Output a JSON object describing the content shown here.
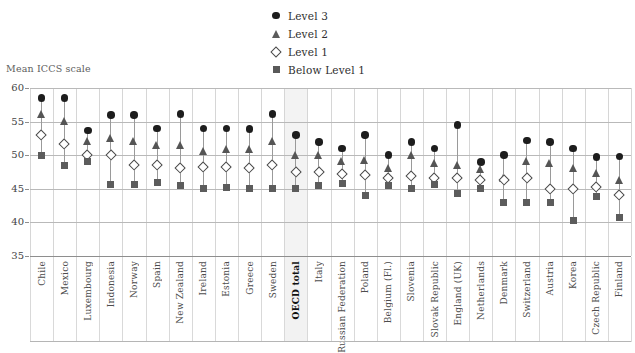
{
  "legend": {
    "position": "top-center",
    "items": [
      {
        "label": "Level 3",
        "marker": "filled-circle-icon",
        "color": "#1d1d1d"
      },
      {
        "label": "Level 2",
        "marker": "filled-triangle-icon",
        "color": "#555555"
      },
      {
        "label": "Level 1",
        "marker": "open-diamond-icon",
        "color": "#4a4a4a"
      },
      {
        "label": "Below Level 1",
        "marker": "filled-square-icon",
        "color": "#5c5c5c"
      }
    ]
  },
  "axis": {
    "y_title": "Mean ICCS scale",
    "y_ticks": [
      "60",
      "55",
      "50",
      "45",
      "40",
      "35"
    ]
  },
  "chart_data": {
    "type": "scatter",
    "title": "",
    "subtitle": "",
    "xlabel": "",
    "ylabel": "Mean ICCS scale",
    "ylim": [
      35,
      60
    ],
    "ytick_values": [
      35,
      40,
      45,
      50,
      55,
      60
    ],
    "grid": true,
    "legend_position": "top-center",
    "highlight_category": "OECD total",
    "categories": [
      "Chile",
      "Mexico",
      "Luxembourg",
      "Indonesia",
      "Norway",
      "Spain",
      "New Zealand",
      "Ireland",
      "Estonia",
      "Greece",
      "Sweden",
      "OECD total",
      "Italy",
      "Russian Federation",
      "Poland",
      "Belgium (Fl.)",
      "Slovenia",
      "Slovak Republic",
      "England (UK)",
      "Netherlands",
      "Denmark",
      "Switzerland",
      "Austria",
      "Korea",
      "Czech Republic",
      "Finland"
    ],
    "series": [
      {
        "name": "Level 3",
        "marker": "filled-circle",
        "values": [
          58.5,
          58.5,
          53.7,
          56.0,
          56.0,
          54.0,
          56.1,
          54.0,
          54.0,
          53.9,
          56.1,
          53.0,
          52.0,
          51.0,
          53.0,
          50.0,
          52.0,
          51.0,
          54.5,
          49.0,
          50.0,
          52.2,
          52.0,
          51.0,
          49.7,
          49.8
        ]
      },
      {
        "name": "Level 2",
        "marker": "filled-triangle",
        "values": [
          56.0,
          55.0,
          52.0,
          52.5,
          52.0,
          51.5,
          51.5,
          50.5,
          50.8,
          50.8,
          52.0,
          50.0,
          50.0,
          49.0,
          49.2,
          48.0,
          50.0,
          48.7,
          48.5,
          47.8,
          46.5,
          49.0,
          48.8,
          48.0,
          47.3,
          46.3
        ]
      },
      {
        "name": "Level 1",
        "marker": "open-diamond",
        "values": [
          53.0,
          51.6,
          50.0,
          50.0,
          48.5,
          48.5,
          48.0,
          48.2,
          48.2,
          48.0,
          48.5,
          47.5,
          47.5,
          47.2,
          47.0,
          46.5,
          46.8,
          46.5,
          46.5,
          46.3,
          46.3,
          46.5,
          45.0,
          45.0,
          45.2,
          44.0
        ]
      },
      {
        "name": "Below Level 1",
        "marker": "filled-square",
        "values": [
          50.0,
          48.5,
          49.0,
          45.6,
          45.7,
          46.0,
          45.5,
          45.0,
          45.2,
          45.0,
          45.0,
          45.0,
          45.5,
          45.8,
          44.0,
          45.5,
          45.0,
          45.7,
          44.3,
          45.0,
          43.0,
          43.0,
          43.0,
          40.3,
          43.8,
          40.8
        ]
      }
    ]
  }
}
